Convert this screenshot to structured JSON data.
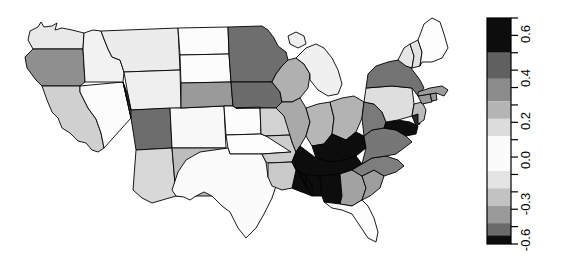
{
  "figure": {
    "type": "choropleth-map",
    "region": "United States (contiguous 48 states)",
    "background_color": "#ffffff",
    "border_color": "#000000"
  },
  "chart_data": {
    "type": "heatmap",
    "title": "",
    "xlabel": "",
    "ylabel": "",
    "colorbar": {
      "orientation": "vertical",
      "vmin": -0.6,
      "vmax": 0.7,
      "tick_labels": [
        "0.6",
        "0.4",
        "0.2",
        "0.0",
        "-0.3",
        "-0.6"
      ],
      "tick_values": [
        0.6,
        0.4,
        0.2,
        0.0,
        -0.3,
        -0.6
      ],
      "minor_ticks": 13,
      "label_rotation": -90,
      "bands": [
        {
          "from": 0.5,
          "to": 0.7,
          "color": "#0d0d0d"
        },
        {
          "from": 0.35,
          "to": 0.5,
          "color": "#606060"
        },
        {
          "from": 0.22,
          "to": 0.35,
          "color": "#8c8c8c"
        },
        {
          "from": 0.12,
          "to": 0.22,
          "color": "#b4b4b4"
        },
        {
          "from": 0.02,
          "to": 0.12,
          "color": "#dcdcdc"
        },
        {
          "from": -0.18,
          "to": 0.02,
          "color": "#fbfbfb"
        },
        {
          "from": -0.28,
          "to": -0.18,
          "color": "#e4e4e4"
        },
        {
          "from": -0.38,
          "to": -0.28,
          "color": "#c2c2c2"
        },
        {
          "from": -0.48,
          "to": -0.38,
          "color": "#9a9a9a"
        },
        {
          "from": -0.55,
          "to": -0.48,
          "color": "#6a6a6a"
        },
        {
          "from": -0.6,
          "to": -0.55,
          "color": "#0d0d0d"
        }
      ]
    },
    "states": [
      {
        "code": "WA",
        "name": "Washington",
        "value": 0.05,
        "color": "#e9e9e9"
      },
      {
        "code": "OR",
        "name": "Oregon",
        "value": 0.33,
        "color": "#8f8f8f"
      },
      {
        "code": "CA",
        "name": "California",
        "value": 0.12,
        "color": "#d0d0d0"
      },
      {
        "code": "NV",
        "name": "Nevada",
        "value": -0.05,
        "color": "#fcfcfc"
      },
      {
        "code": "ID",
        "name": "Idaho",
        "value": 0.02,
        "color": "#f2f2f2"
      },
      {
        "code": "MT",
        "name": "Montana",
        "value": 0.04,
        "color": "#ececec"
      },
      {
        "code": "WY",
        "name": "Wyoming",
        "value": 0.03,
        "color": "#efefef"
      },
      {
        "code": "UT",
        "name": "Utah",
        "value": 0.42,
        "color": "#6d6d6d"
      },
      {
        "code": "AZ",
        "name": "Arizona",
        "value": 0.1,
        "color": "#d8d8d8"
      },
      {
        "code": "CO",
        "name": "Colorado",
        "value": 0.0,
        "color": "#f8f8f8"
      },
      {
        "code": "NM",
        "name": "New Mexico",
        "value": 0.18,
        "color": "#bdbdbd"
      },
      {
        "code": "ND",
        "name": "North Dakota",
        "value": -0.02,
        "color": "#fcfcfc"
      },
      {
        "code": "SD",
        "name": "South Dakota",
        "value": -0.02,
        "color": "#fcfcfc"
      },
      {
        "code": "NE",
        "name": "Nebraska",
        "value": 0.3,
        "color": "#9a9a9a"
      },
      {
        "code": "KS",
        "name": "Kansas",
        "value": -0.03,
        "color": "#fcfcfc"
      },
      {
        "code": "OK",
        "name": "Oklahoma",
        "value": -0.04,
        "color": "#fdfdfd"
      },
      {
        "code": "TX",
        "name": "Texas",
        "value": -0.03,
        "color": "#fbfbfb"
      },
      {
        "code": "MN",
        "name": "Minnesota",
        "value": 0.4,
        "color": "#6e6e6e"
      },
      {
        "code": "IA",
        "name": "Iowa",
        "value": 0.41,
        "color": "#6c6c6c"
      },
      {
        "code": "MO",
        "name": "Missouri",
        "value": 0.12,
        "color": "#d2d2d2"
      },
      {
        "code": "AR",
        "name": "Arkansas",
        "value": 0.13,
        "color": "#cdcdcd"
      },
      {
        "code": "LA",
        "name": "Louisiana",
        "value": 0.14,
        "color": "#cacaca"
      },
      {
        "code": "WI",
        "name": "Wisconsin",
        "value": 0.22,
        "color": "#b0b0b0"
      },
      {
        "code": "IL",
        "name": "Illinois",
        "value": 0.24,
        "color": "#a9a9a9"
      },
      {
        "code": "MI",
        "name": "Michigan",
        "value": 0.02,
        "color": "#f0f0f0"
      },
      {
        "code": "IN",
        "name": "Indiana",
        "value": 0.2,
        "color": "#b6b6b6"
      },
      {
        "code": "OH",
        "name": "Ohio",
        "value": 0.21,
        "color": "#b3b3b3"
      },
      {
        "code": "KY",
        "name": "Kentucky",
        "value": 0.65,
        "color": "#0d0d0d"
      },
      {
        "code": "TN",
        "name": "Tennessee",
        "value": 0.66,
        "color": "#0d0d0d"
      },
      {
        "code": "MS",
        "name": "Mississippi",
        "value": 0.64,
        "color": "#0d0d0d"
      },
      {
        "code": "AL",
        "name": "Alabama",
        "value": 0.63,
        "color": "#0d0d0d"
      },
      {
        "code": "GA",
        "name": "Georgia",
        "value": 0.26,
        "color": "#a2a2a2"
      },
      {
        "code": "FL",
        "name": "Florida",
        "value": -0.05,
        "color": "#fdfdfd"
      },
      {
        "code": "SC",
        "name": "South Carolina",
        "value": 0.27,
        "color": "#9e9e9e"
      },
      {
        "code": "NC",
        "name": "North Carolina",
        "value": 0.36,
        "color": "#7e7e7e"
      },
      {
        "code": "VA",
        "name": "Virginia",
        "value": 0.38,
        "color": "#777777"
      },
      {
        "code": "WV",
        "name": "West Virginia",
        "value": 0.37,
        "color": "#7a7a7a"
      },
      {
        "code": "MD",
        "name": "Maryland",
        "value": 0.62,
        "color": "#0d0d0d"
      },
      {
        "code": "DE",
        "name": "Delaware",
        "value": 0.55,
        "color": "#2a2a2a"
      },
      {
        "code": "PA",
        "name": "Pennsylvania",
        "value": 0.08,
        "color": "#dedede"
      },
      {
        "code": "NJ",
        "name": "New Jersey",
        "value": 0.18,
        "color": "#bbbbbb"
      },
      {
        "code": "NY",
        "name": "New York",
        "value": 0.39,
        "color": "#737373"
      },
      {
        "code": "CT",
        "name": "Connecticut",
        "value": 0.3,
        "color": "#9a9a9a"
      },
      {
        "code": "RI",
        "name": "Rhode Island",
        "value": 0.3,
        "color": "#9a9a9a"
      },
      {
        "code": "MA",
        "name": "Massachusetts",
        "value": 0.28,
        "color": "#9c9c9c"
      },
      {
        "code": "VT",
        "name": "Vermont",
        "value": 0.05,
        "color": "#e6e6e6"
      },
      {
        "code": "NH",
        "name": "New Hampshire",
        "value": 0.06,
        "color": "#e2e2e2"
      },
      {
        "code": "ME",
        "name": "Maine",
        "value": -0.06,
        "color": "#fdfdfd"
      }
    ]
  }
}
